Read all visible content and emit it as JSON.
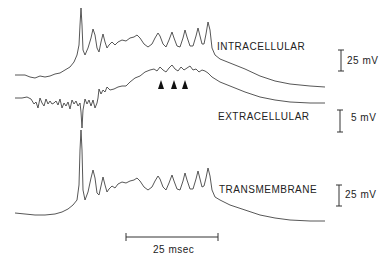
{
  "figure": {
    "traces": [
      {
        "name": "intracellular",
        "label": "INTRACELLULAR",
        "scale_bar": "25 mV"
      },
      {
        "name": "extracellular",
        "label": "EXTRACELLULAR",
        "scale_bar": "5 mV"
      },
      {
        "name": "transmembrane",
        "label": "TRANSMEMBRANE",
        "scale_bar": "25 mV"
      }
    ],
    "time_scale": "25 msec",
    "arrowheads": 3,
    "colors": {
      "trace": "#333333",
      "background": "#ffffff",
      "text": "#222222"
    }
  }
}
